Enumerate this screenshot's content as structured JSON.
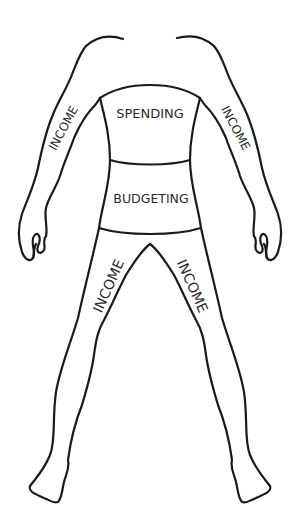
{
  "figure": {
    "type": "body-outline-diagram",
    "line_color": "#1a1a1a",
    "background": "#ffffff"
  },
  "regions": {
    "upper_torso": {
      "label": "SPENDING"
    },
    "lower_torso": {
      "label": "BUDGETING"
    },
    "left_arm": {
      "label": "INCOME"
    },
    "right_arm": {
      "label": "INCOME"
    },
    "left_leg": {
      "label": "INCOME"
    },
    "right_leg": {
      "label": "INCOME"
    }
  }
}
